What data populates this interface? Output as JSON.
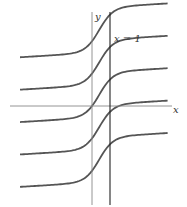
{
  "figure": {
    "axis_x_label": "x",
    "axis_y_label": "y",
    "asymptote_label": "x = 1",
    "curve_color": "#555555",
    "axis_color": "#888888",
    "line_color": "#222222"
  },
  "chart_data": {
    "type": "line",
    "title": "",
    "xlabel": "x",
    "ylabel": "y",
    "xlim": [
      -4.5,
      4.5
    ],
    "ylim": [
      -5.5,
      5.5
    ],
    "vertical_line": {
      "x": 1,
      "label": "x = 1"
    },
    "grid": false,
    "series": [
      {
        "name": "curve-1",
        "offset": 3.6
      },
      {
        "name": "curve-2",
        "offset": 1.8
      },
      {
        "name": "curve-3",
        "offset": 0.0
      },
      {
        "name": "curve-4",
        "offset": -1.8
      },
      {
        "name": "curve-5",
        "offset": -3.6
      }
    ]
  }
}
